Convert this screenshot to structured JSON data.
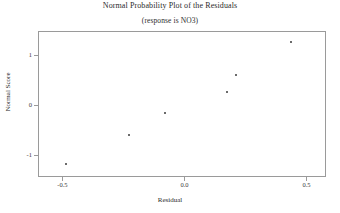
{
  "chart_data": {
    "type": "scatter",
    "title": "Normal Probability Plot of the Residuals",
    "subtitle": "(response is NO3)",
    "xlabel": "Residual",
    "ylabel": "Normal Score",
    "xlim": [
      -0.6,
      0.58
    ],
    "ylim": [
      -1.45,
      1.48
    ],
    "grid": false,
    "legend": null,
    "xticks": [
      -0.5,
      0.0,
      0.5
    ],
    "xticklabels": [
      "-0.5",
      "0.0",
      "0.5"
    ],
    "yticks": [
      -1,
      0,
      1
    ],
    "yticklabels": [
      "-1",
      "0",
      "1"
    ],
    "marker": "square",
    "marker_color": "#6b6b6b",
    "points": [
      {
        "x": -0.486,
        "y": -1.18
      },
      {
        "x": -0.226,
        "y": -0.61
      },
      {
        "x": -0.081,
        "y": -0.17
      },
      {
        "x": 0.175,
        "y": 0.26
      },
      {
        "x": 0.21,
        "y": 0.6
      },
      {
        "x": 0.438,
        "y": 1.26
      }
    ],
    "x": [
      -0.486,
      -0.226,
      -0.081,
      0.175,
      0.21,
      0.438
    ],
    "values": [
      -1.18,
      -0.61,
      -0.17,
      0.26,
      0.6,
      1.26
    ]
  }
}
